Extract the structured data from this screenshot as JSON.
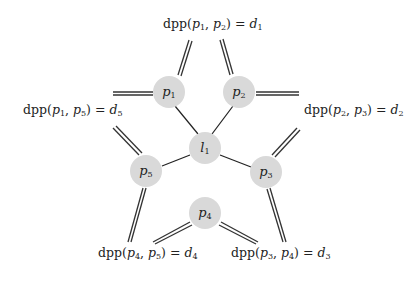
{
  "diagram": {
    "nodes": [
      {
        "id": "p1",
        "base": "p",
        "sub": "1",
        "x": 169,
        "y": 92
      },
      {
        "id": "p2",
        "base": "p",
        "sub": "2",
        "x": 239,
        "y": 92
      },
      {
        "id": "p3",
        "base": "p",
        "sub": "3",
        "x": 266,
        "y": 172
      },
      {
        "id": "p4",
        "base": "p",
        "sub": "4",
        "x": 205,
        "y": 213
      },
      {
        "id": "p5",
        "base": "p",
        "sub": "5",
        "x": 146,
        "y": 171
      },
      {
        "id": "l1",
        "base": "l",
        "sub": "1",
        "x": 205,
        "y": 148
      }
    ],
    "node_color": "#d9d9d9",
    "edges_single": [
      [
        "l1",
        "p1"
      ],
      [
        "l1",
        "p2"
      ],
      [
        "l1",
        "p3"
      ],
      [
        "l1",
        "p5"
      ]
    ],
    "labels": [
      {
        "id": "d1",
        "fn": "dpp",
        "a": "p",
        "as": "1",
        "b": "p",
        "bs": "2",
        "d": "d",
        "ds": "1",
        "x": 160,
        "y": 20
      },
      {
        "id": "d2",
        "fn": "dpp",
        "a": "p",
        "as": "2",
        "b": "p",
        "bs": "3",
        "d": "d",
        "ds": "2",
        "x": 303,
        "y": 101
      },
      {
        "id": "d3",
        "fn": "dpp",
        "a": "p",
        "as": "3",
        "b": "p",
        "bs": "4",
        "d": "d",
        "ds": "3",
        "x": 230,
        "y": 248
      },
      {
        "id": "d4",
        "fn": "dpp",
        "a": "p",
        "as": "4",
        "b": "p",
        "bs": "5",
        "d": "d",
        "ds": "4",
        "x": 97,
        "y": 248
      },
      {
        "id": "d5",
        "fn": "dpp",
        "a": "p",
        "as": "1",
        "b": "p",
        "bs": "5",
        "d": "d",
        "ds": "5",
        "x": 22,
        "y": 101
      }
    ]
  }
}
